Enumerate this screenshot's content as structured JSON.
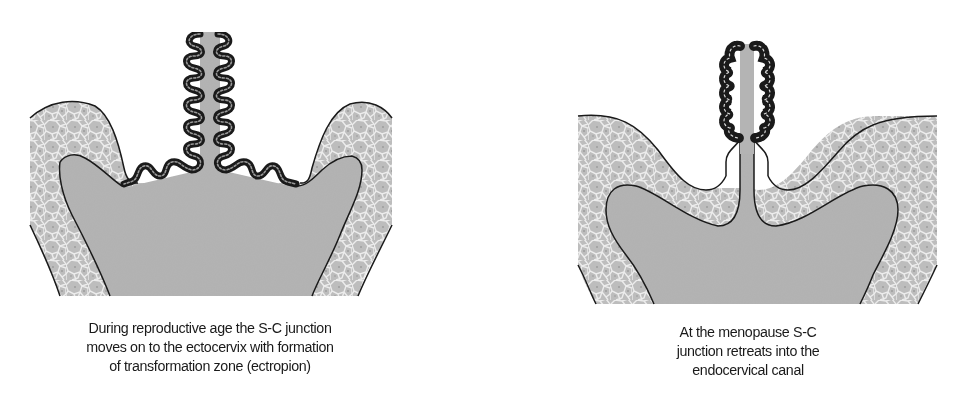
{
  "figure": {
    "panels": [
      {
        "id": "reproductive-age",
        "caption_lines": [
          "During reproductive age the S-C junction",
          "moves on to the ectocervix with formation",
          "of transformation zone (ectropion)"
        ]
      },
      {
        "id": "menopause",
        "caption_lines": [
          "At the menopause S-C",
          "junction retreats into the",
          "endocervical canal"
        ]
      }
    ],
    "colors": {
      "background": "#ffffff",
      "stroma": "#b4b4b4",
      "squamous_epithelium": "#bdbdbd",
      "cell_borders": "#e8e8e8",
      "outline": "#1a1a1a",
      "columnar_epithelium": "#2a2a2a"
    }
  }
}
